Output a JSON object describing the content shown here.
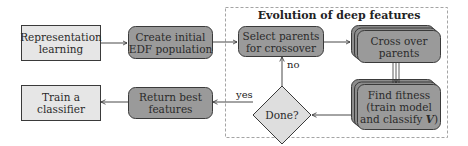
{
  "diagram": {
    "group": {
      "title": "Evolution of deep features"
    },
    "nodes": {
      "representation_learning": {
        "line1": "Representation",
        "line2": "learning"
      },
      "create_population": {
        "line1": "Create initial",
        "line2": "EDF population"
      },
      "select_parents": {
        "line1": "Select parents",
        "line2": "for crossover"
      },
      "cross_over": {
        "line1": "Cross over",
        "line2": "parents"
      },
      "find_fitness": {
        "line1": "Find fitness",
        "line2": "(train model",
        "line3_pre": "and classify ",
        "line3_var": "V",
        "line3_post": ")"
      },
      "done": {
        "label": "Done?"
      },
      "return_best": {
        "line1": "Return best",
        "line2": "features"
      },
      "train_classifier": {
        "line1": "Train a",
        "line2": "classifier"
      }
    },
    "edge_labels": {
      "no": "no",
      "yes": "yes"
    },
    "colors": {
      "light_box": "#e6e6e6",
      "dark_box": "#9a9a9a",
      "diamond": "#dedede",
      "stroke": "#3a3a3a",
      "dashed": "#9a9a9a"
    }
  }
}
